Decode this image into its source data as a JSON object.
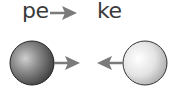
{
  "labels": {
    "left": "pe",
    "right": "ke"
  },
  "arrows": {
    "top": {
      "direction": "right",
      "color": "#7a7a7a"
    },
    "left_sphere": {
      "direction": "right",
      "color": "#7a7a7a"
    },
    "right_sphere": {
      "direction": "left",
      "color": "#7a7a7a"
    }
  },
  "spheres": {
    "left": {
      "shade": "dark",
      "color": "#6a6a6a"
    },
    "right": {
      "shade": "light",
      "color": "#d8d8d8"
    }
  }
}
